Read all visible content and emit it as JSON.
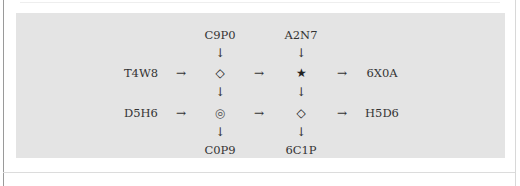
{
  "diagram": {
    "background_panel_color": "#e4e4e4",
    "top_inputs": [
      {
        "id": "top-left",
        "label": "C9P0"
      },
      {
        "id": "top-right",
        "label": "A2N7"
      }
    ],
    "rows": [
      {
        "input": "T4W8",
        "arrows": [
          "→",
          "→",
          "→"
        ],
        "junctions": [
          {
            "symbol": "◇",
            "name": "diamond"
          },
          {
            "symbol": "★",
            "name": "star"
          }
        ],
        "output": "6X0A"
      },
      {
        "input": "D5H6",
        "arrows": [
          "→",
          "→",
          "→"
        ],
        "junctions": [
          {
            "symbol": "◎",
            "name": "bullseye"
          },
          {
            "symbol": "◇",
            "name": "diamond"
          }
        ],
        "output": "H5D6"
      }
    ],
    "vertical_arrows": {
      "top_to_row1": [
        "↓",
        "↓"
      ],
      "row1_to_row2": [
        "↓",
        "↓"
      ],
      "row2_to_bottom": [
        "↓",
        "↓"
      ]
    },
    "bottom_outputs": [
      {
        "id": "bottom-left",
        "label": "C0P9"
      },
      {
        "id": "bottom-right",
        "label": "6C1P"
      }
    ]
  }
}
